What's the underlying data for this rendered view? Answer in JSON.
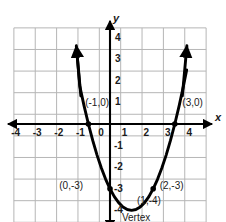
{
  "figure": {
    "title": "",
    "axis_labels": {
      "x": "x",
      "y": "y"
    }
  },
  "chart_data": {
    "type": "line",
    "title": "",
    "xlabel": "x",
    "ylabel": "y",
    "grid": true,
    "legend": "none",
    "xlim": [
      -4.5,
      4.5
    ],
    "ylim": [
      -4.6,
      4.5
    ],
    "xticks": [
      -4,
      -3,
      -2,
      -1,
      0,
      1,
      2,
      3,
      4
    ],
    "xtick_labels": [
      "-4",
      "-3",
      "-2",
      "-1",
      "0",
      "1",
      "2",
      "3",
      "4"
    ],
    "yticks": [
      -4,
      -3,
      -2,
      -1,
      1,
      2,
      3,
      4
    ],
    "ytick_labels": [
      "-4",
      "-3",
      "-2",
      "-1",
      "1",
      "2",
      "3",
      "4"
    ],
    "origin_label": "0",
    "series": [
      {
        "name": "parabola",
        "equation": "y = x^2 - 2x - 3",
        "color": "#000000",
        "x": [
          -1.55,
          -1.4,
          -1.2,
          -1.0,
          -0.8,
          -0.6,
          -0.4,
          -0.2,
          0.0,
          0.2,
          0.4,
          0.6,
          0.8,
          1.0,
          1.2,
          1.4,
          1.6,
          1.8,
          2.0,
          2.2,
          2.4,
          2.6,
          2.8,
          3.0,
          3.2,
          3.4,
          3.55
        ],
        "y": [
          3.5,
          1.76,
          0.84,
          0.0,
          -0.76,
          -1.44,
          -2.04,
          -2.56,
          -3.0,
          -3.36,
          -3.64,
          -3.84,
          -3.96,
          -4.0,
          -3.96,
          -3.84,
          -3.64,
          -3.36,
          -3.0,
          -2.56,
          -2.04,
          -1.44,
          -0.76,
          0.0,
          0.84,
          1.76,
          2.5
        ]
      }
    ],
    "points": [
      {
        "label": "(-1,0)",
        "x": -1,
        "y": 0,
        "label_dx": -0.15,
        "label_dy": 0.95,
        "marker": true
      },
      {
        "label": "(3,0)",
        "x": 3,
        "y": 0,
        "label_dx": 0.35,
        "label_dy": 0.95,
        "marker": true
      },
      {
        "label": "(0,-3)",
        "x": 0,
        "y": -3,
        "label_dx": -2.35,
        "label_dy": 0.12,
        "marker": true
      },
      {
        "label": "(2,-3)",
        "x": 2,
        "y": -3,
        "label_dx": 0.3,
        "label_dy": 0.12,
        "marker": true
      },
      {
        "label": "(1,-4)",
        "x": 1,
        "y": -4,
        "label_dx": 0.25,
        "label_dy": 0.45,
        "marker": false
      }
    ],
    "annotations": [
      {
        "text": "Vertex",
        "x": 1,
        "y": -4,
        "dx": 0.2,
        "dy": -0.35
      }
    ],
    "arrows": {
      "x_axis": [
        "left",
        "right"
      ],
      "y_axis": [
        "up",
        "down"
      ],
      "curve": [
        "upper-left",
        "upper-right"
      ]
    }
  }
}
